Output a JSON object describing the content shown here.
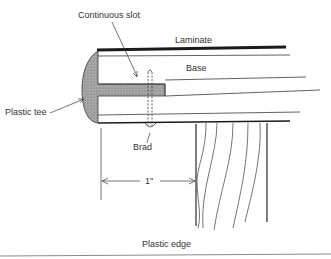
{
  "diagram": {
    "title": "Plastic edge",
    "labels": {
      "continuous_slot": "Continuous slot",
      "laminate": "Laminate",
      "base": "Base",
      "plastic_tee": "Plastic tee",
      "brad": "Brad",
      "dimension": "1\""
    }
  },
  "colors": {
    "line": "#3a3a3a",
    "tee_fill": "#9a9a9a",
    "laminate": "#1a1a1a",
    "background": "#ffffff"
  }
}
